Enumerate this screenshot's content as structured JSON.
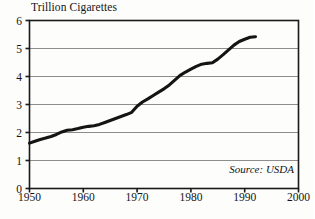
{
  "chart_data": {
    "type": "line",
    "title": "Trillion Cigarettes",
    "xlabel": "",
    "ylabel": "Trillion Cigarettes",
    "xlim": [
      1950,
      2000
    ],
    "ylim": [
      0,
      6
    ],
    "grid": true,
    "legend": null,
    "annotation": "Source: USDA",
    "y_ticks": [
      0,
      1,
      2,
      3,
      4,
      5,
      6
    ],
    "y_tick_labels": [
      "0",
      "1",
      "2",
      "3",
      "4",
      "5",
      "6"
    ],
    "x_ticks": [
      1950,
      1960,
      1970,
      1980,
      1990,
      2000
    ],
    "x_tick_labels": [
      "1950",
      "1960",
      "1970",
      "1980",
      "1990",
      "2000"
    ],
    "series": [
      {
        "name": "World Cigarette Production",
        "x": [
          1950,
          1951,
          1952,
          1953,
          1954,
          1955,
          1956,
          1957,
          1958,
          1959,
          1960,
          1961,
          1962,
          1963,
          1964,
          1965,
          1966,
          1967,
          1968,
          1969,
          1970,
          1971,
          1972,
          1973,
          1974,
          1975,
          1976,
          1977,
          1978,
          1979,
          1980,
          1981,
          1982,
          1983,
          1984,
          1985,
          1986,
          1987,
          1988,
          1989,
          1990,
          1991,
          1992
        ],
        "values": [
          1.62,
          1.69,
          1.75,
          1.8,
          1.86,
          1.93,
          2.02,
          2.08,
          2.1,
          2.14,
          2.19,
          2.22,
          2.24,
          2.29,
          2.36,
          2.43,
          2.5,
          2.57,
          2.64,
          2.72,
          2.94,
          3.09,
          3.2,
          3.32,
          3.44,
          3.56,
          3.7,
          3.87,
          4.04,
          4.16,
          4.26,
          4.36,
          4.44,
          4.47,
          4.49,
          4.62,
          4.78,
          4.95,
          5.12,
          5.25,
          5.33,
          5.4,
          5.42
        ]
      }
    ]
  }
}
